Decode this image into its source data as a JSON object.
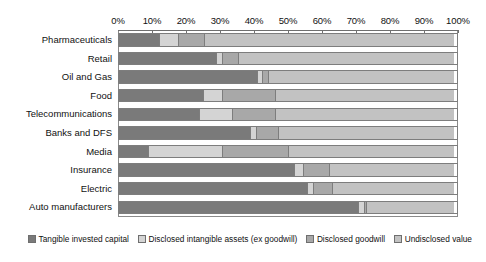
{
  "chart_data": {
    "type": "bar",
    "orientation": "horizontal",
    "stacked": true,
    "normalized": true,
    "title": "",
    "subtitle": "",
    "xlabel": "",
    "ylabel": "",
    "xlim": [
      0,
      100
    ],
    "grid": false,
    "legend_position": "bottom",
    "x_tick_labels": [
      "0%",
      "10%",
      "20%",
      "30%",
      "40%",
      "50%",
      "60%",
      "70%",
      "80%",
      "90%",
      "100%"
    ],
    "x_tick_values": [
      0,
      10,
      20,
      30,
      40,
      50,
      60,
      70,
      80,
      90,
      100
    ],
    "categories": [
      "Pharmaceuticals",
      "Retail",
      "Oil and Gas",
      "Food",
      "Telecommunications",
      "Banks and DFS",
      "Media",
      "Insurance",
      "Electric",
      "Auto manufacturers"
    ],
    "series": [
      {
        "name": "Tangible invested capital",
        "color": "#7a7a7a",
        "values": [
          12,
          29,
          41,
          25,
          24,
          39,
          9,
          52,
          56,
          71
        ]
      },
      {
        "name": "Disclosed intangible assets (ex goodwill)",
        "color": "#d4d4d4",
        "values": [
          6,
          2,
          2,
          6,
          10,
          2,
          22,
          3,
          2,
          2
        ]
      },
      {
        "name": "Disclosed goodwill",
        "color": "#a8a8a8",
        "values": [
          8,
          5,
          2,
          16,
          13,
          7,
          20,
          8,
          6,
          1
        ]
      },
      {
        "name": "Undisclosed value",
        "color": "#c2c2c2",
        "values": [
          74,
          64,
          55,
          53,
          53,
          52,
          49,
          37,
          36,
          26
        ]
      }
    ]
  },
  "legend": {
    "items": [
      {
        "label": "Tangible invested capital"
      },
      {
        "label": "Disclosed intangible assets (ex goodwill)"
      },
      {
        "label": "Disclosed goodwill"
      },
      {
        "label": "Undisclosed value"
      }
    ]
  },
  "colors": {
    "series_tangible": "#7a7a7a",
    "series_disclosed_intangible": "#d4d4d4",
    "series_disclosed_goodwill": "#a8a8a8",
    "series_undisclosed": "#c2c2c2",
    "axis": "#6f6f6f",
    "frame": "#8a8a8a",
    "background": "#ffffff",
    "text": "#111111"
  }
}
